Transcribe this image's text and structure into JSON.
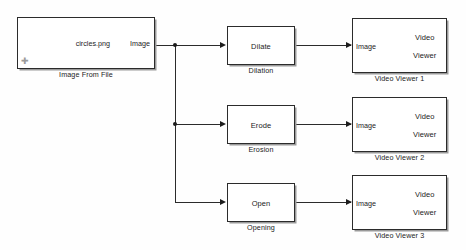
{
  "diagram": {
    "background_color": "#fefefe",
    "line_color": "#2b2b2b",
    "text_color": "#1c1c1c"
  },
  "blocks": {
    "image_from_file": {
      "file_label": "circles.png",
      "output_port_label": "Image",
      "caption": "Image From File",
      "badge_icon": "move-cursor-icon"
    },
    "dilation": {
      "body_label": "Dilate",
      "caption": "Dilation"
    },
    "erosion": {
      "body_label": "Erode",
      "caption": "Erosion"
    },
    "opening": {
      "body_label": "Open",
      "caption": "Opening"
    },
    "viewer1": {
      "input_port_label": "Image",
      "body_line1": "Video",
      "body_line2": "Viewer",
      "caption": "Video Viewer 1"
    },
    "viewer2": {
      "input_port_label": "Image",
      "body_line1": "Video",
      "body_line2": "Viewer",
      "caption": "Video Viewer 2"
    },
    "viewer3": {
      "input_port_label": "Image",
      "body_line1": "Video",
      "body_line2": "Viewer",
      "caption": "Video Viewer 3"
    }
  }
}
